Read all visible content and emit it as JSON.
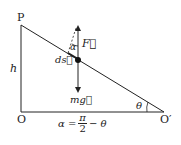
{
  "diagram": {
    "labels": {
      "P": "P",
      "O": "O",
      "O_prime": "O′",
      "h": "h",
      "F": "F⃗",
      "alpha": "α",
      "ds": "ds⃗",
      "mg": "mg⃗",
      "theta": "θ",
      "formula_lhs": "α =",
      "formula_num": "π",
      "formula_den": "2",
      "formula_rhs": "− θ"
    },
    "colors": {
      "line": "#222222",
      "background": "#ffffff"
    }
  }
}
